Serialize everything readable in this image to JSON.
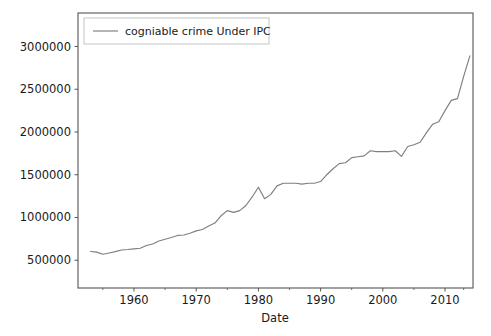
{
  "figure": {
    "width": 491,
    "height": 336,
    "background": "#ffffff"
  },
  "axes": {
    "left": 78,
    "right": 473,
    "top": 13,
    "bottom": 288,
    "spine_color": "#555555"
  },
  "legend": {
    "position": "upper left",
    "entries": [
      {
        "label": "cogniable crime Under IPC",
        "color": "#7f7f7f"
      }
    ]
  },
  "chart_data": {
    "type": "line",
    "title": "",
    "xlabel": "Date",
    "ylabel": "",
    "xlim": [
      1951,
      2014.5
    ],
    "ylim": [
      175000,
      3392000
    ],
    "grid": false,
    "legend_position": "upper left",
    "xticks": [
      1960,
      1970,
      1980,
      1990,
      2000,
      2010
    ],
    "xtick_labels": [
      "1960",
      "1970",
      "1980",
      "1990",
      "2000",
      "2010"
    ],
    "xticks_minor": [
      1955,
      1965,
      1975,
      1985,
      1995,
      2005,
      2013
    ],
    "yticks": [
      500000,
      1000000,
      1500000,
      2000000,
      2500000,
      3000000
    ],
    "ytick_labels": [
      "500000",
      "1000000",
      "1500000",
      "2000000",
      "2500000",
      "3000000"
    ],
    "series": [
      {
        "name": "cogniable crime Under IPC",
        "color": "#7f7f7f",
        "x": [
          1953,
          1954,
          1955,
          1956,
          1957,
          1958,
          1959,
          1960,
          1961,
          1962,
          1963,
          1964,
          1965,
          1966,
          1967,
          1968,
          1969,
          1970,
          1971,
          1972,
          1973,
          1974,
          1975,
          1976,
          1977,
          1978,
          1979,
          1980,
          1981,
          1982,
          1983,
          1984,
          1985,
          1986,
          1987,
          1988,
          1989,
          1990,
          1991,
          1992,
          1993,
          1994,
          1995,
          1996,
          1997,
          1998,
          1999,
          2000,
          2001,
          2002,
          2003,
          2004,
          2005,
          2006,
          2007,
          2008,
          2009,
          2010,
          2011,
          2012,
          2013,
          2014
        ],
        "values": [
          601964,
          595000,
          570000,
          585000,
          600000,
          620000,
          625000,
          632000,
          640000,
          672000,
          690000,
          725000,
          745000,
          765000,
          790000,
          795000,
          815000,
          843000,
          860000,
          900000,
          935000,
          1020000,
          1080000,
          1060000,
          1080000,
          1140000,
          1240000,
          1354000,
          1220000,
          1270000,
          1370000,
          1400000,
          1400000,
          1400000,
          1390000,
          1400000,
          1400000,
          1420000,
          1500000,
          1570000,
          1630000,
          1640000,
          1700000,
          1710000,
          1720000,
          1780000,
          1770000,
          1770000,
          1770000,
          1780000,
          1715000,
          1830000,
          1850000,
          1880000,
          1990000,
          2090000,
          2120000,
          2250000,
          2370000,
          2390000,
          2650000,
          2890000
        ]
      }
    ]
  }
}
